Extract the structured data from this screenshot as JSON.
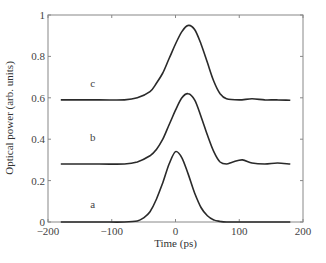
{
  "chart_data": {
    "type": "line",
    "title": "",
    "xlabel": "Time (ps)",
    "ylabel": "Optical power (arb. units)",
    "xlim": [
      -200,
      200
    ],
    "ylim": [
      0,
      1
    ],
    "xticks": [
      -200,
      -100,
      0,
      100,
      200
    ],
    "xtick_labels": [
      "−200",
      "−100",
      "0",
      "100",
      "200"
    ],
    "yticks": [
      0,
      0.2,
      0.4,
      0.6,
      0.8,
      1
    ],
    "ytick_labels": [
      "0",
      "0.2",
      "0.4",
      "0.6",
      "0.8",
      "1"
    ],
    "grid": false,
    "legend": "none",
    "annotations": [
      {
        "text": "c",
        "x": -130,
        "y": 0.65
      },
      {
        "text": "b",
        "x": -130,
        "y": 0.39
      },
      {
        "text": "a",
        "x": -130,
        "y": 0.07
      }
    ],
    "series": [
      {
        "name": "a",
        "x": [
          -180,
          -120,
          -80,
          -60,
          -50,
          -40,
          -30,
          -20,
          -10,
          0,
          10,
          20,
          30,
          40,
          50,
          60,
          70,
          80,
          120,
          180
        ],
        "values": [
          0.0,
          0.0,
          0.0,
          0.005,
          0.02,
          0.05,
          0.11,
          0.19,
          0.28,
          0.34,
          0.31,
          0.23,
          0.14,
          0.07,
          0.03,
          0.01,
          0.003,
          0.0,
          0.0,
          0.0
        ]
      },
      {
        "name": "b",
        "x": [
          -180,
          -120,
          -80,
          -60,
          -40,
          -30,
          -20,
          -10,
          0,
          10,
          20,
          30,
          40,
          50,
          60,
          70,
          80,
          90,
          105,
          120,
          140,
          160,
          180
        ],
        "values": [
          0.28,
          0.28,
          0.28,
          0.29,
          0.32,
          0.35,
          0.4,
          0.47,
          0.54,
          0.6,
          0.62,
          0.59,
          0.51,
          0.42,
          0.34,
          0.29,
          0.28,
          0.29,
          0.3,
          0.285,
          0.28,
          0.285,
          0.28
        ]
      },
      {
        "name": "c",
        "x": [
          -180,
          -120,
          -80,
          -60,
          -40,
          -30,
          -20,
          -10,
          0,
          10,
          20,
          30,
          40,
          50,
          60,
          70,
          80,
          100,
          120,
          140,
          160,
          180
        ],
        "values": [
          0.59,
          0.59,
          0.59,
          0.6,
          0.63,
          0.67,
          0.72,
          0.79,
          0.86,
          0.92,
          0.95,
          0.93,
          0.86,
          0.77,
          0.68,
          0.62,
          0.595,
          0.59,
          0.595,
          0.59,
          0.59,
          0.588
        ]
      }
    ]
  }
}
